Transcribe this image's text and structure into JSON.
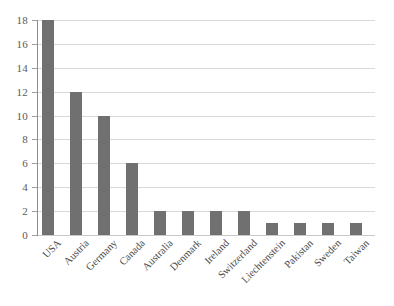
{
  "chart_data": {
    "type": "bar",
    "title": "",
    "subtitle": "",
    "xlabel": "",
    "ylabel": "",
    "categories": [
      "USA",
      "Austria",
      "Germany",
      "Canada",
      "Australia",
      "Denmark",
      "Ireland",
      "Switzerland",
      "Liechtenstein",
      "Pakistan",
      "Sweden",
      "Taiwan"
    ],
    "values": [
      18,
      12,
      10,
      6,
      2,
      2,
      2,
      2,
      1,
      1,
      1,
      1
    ],
    "ylim": [
      0,
      18
    ],
    "ytick_step": 2,
    "ytick_labels": [
      "18",
      "16",
      "14",
      "12",
      "10",
      "8",
      "6",
      "4",
      "2",
      "0"
    ],
    "grid": "horizontal",
    "legend": "none",
    "bar_color": "#707070",
    "gridline_color": "#d9d9d9",
    "axis_color": "#8c8c8c",
    "background_color": "#ffffff",
    "xtick_label_rotation": -45
  }
}
